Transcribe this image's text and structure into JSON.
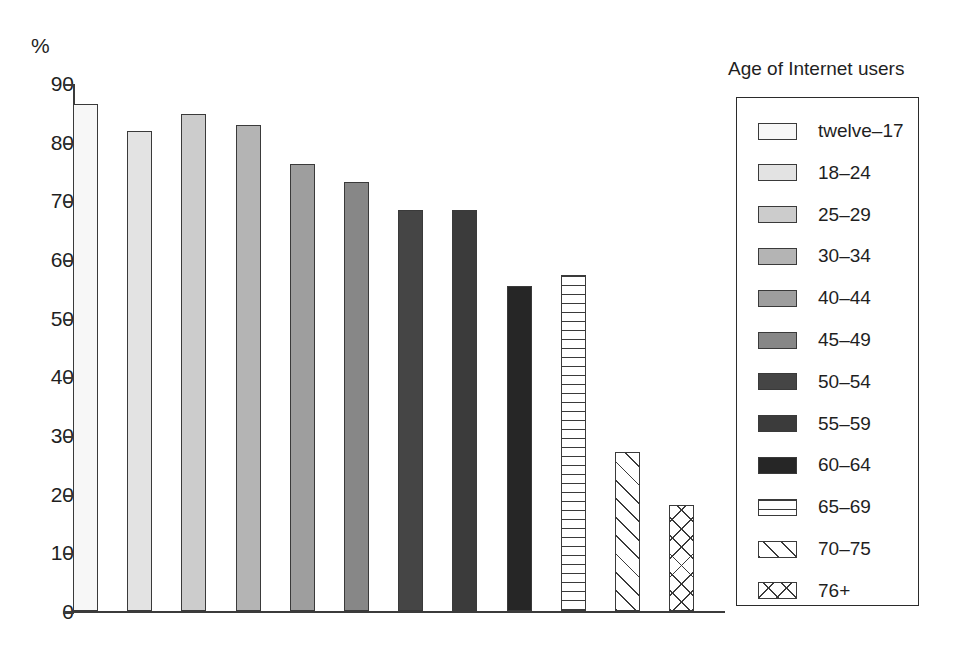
{
  "chart_data": {
    "type": "bar",
    "title": "",
    "xlabel": "",
    "ylabel": "%",
    "ylim": [
      0,
      90
    ],
    "ytick_step": 10,
    "yticks": [
      90,
      80,
      70,
      60,
      50,
      40,
      30,
      20,
      10,
      0
    ],
    "grid": false,
    "legend_position": "right",
    "legend_title": "Age of Internet users",
    "categories": [
      "twelve–17",
      "18–24",
      "25–29",
      "30–34",
      "40–44",
      "45–49",
      "50–54",
      "55–59",
      "60–64",
      "65–69",
      "70–75",
      "76+"
    ],
    "values": [
      86.5,
      81.8,
      84.8,
      82.8,
      76.2,
      73.2,
      68.4,
      68.4,
      55.4,
      57.3,
      27.1,
      18.0
    ],
    "bars": [
      {
        "label": "twelve–17",
        "value": 86.5,
        "fill": "#f7f7f7",
        "pattern": "solid"
      },
      {
        "label": "18–24",
        "value": 81.8,
        "fill": "#e3e3e3",
        "pattern": "solid"
      },
      {
        "label": "25–29",
        "value": 84.8,
        "fill": "#cccccc",
        "pattern": "solid"
      },
      {
        "label": "30–34",
        "value": 82.8,
        "fill": "#b4b4b4",
        "pattern": "solid"
      },
      {
        "label": "40–44",
        "value": 76.2,
        "fill": "#9e9e9e",
        "pattern": "solid"
      },
      {
        "label": "45–49",
        "value": 73.2,
        "fill": "#878787",
        "pattern": "solid"
      },
      {
        "label": "50–54",
        "value": 68.4,
        "fill": "#454545",
        "pattern": "solid"
      },
      {
        "label": "55–59",
        "value": 68.4,
        "fill": "#3b3b3b",
        "pattern": "solid"
      },
      {
        "label": "60–64",
        "value": 55.4,
        "fill": "#262626",
        "pattern": "solid"
      },
      {
        "label": "65–69",
        "value": 57.3,
        "fill": "#ffffff",
        "pattern": "horizontal-stripes"
      },
      {
        "label": "70–75",
        "value": 27.1,
        "fill": "#ffffff",
        "pattern": "diagonal-hatch"
      },
      {
        "label": "76+",
        "value": 18.0,
        "fill": "#ffffff",
        "pattern": "cross-hatch"
      }
    ]
  },
  "legend": {
    "title": "Age of Internet users",
    "items": [
      {
        "label": "twelve–17",
        "fill": "#f7f7f7",
        "pattern": "solid"
      },
      {
        "label": "18–24",
        "fill": "#e3e3e3",
        "pattern": "solid"
      },
      {
        "label": "25–29",
        "fill": "#cccccc",
        "pattern": "solid"
      },
      {
        "label": "30–34",
        "fill": "#b4b4b4",
        "pattern": "solid"
      },
      {
        "label": "40–44",
        "fill": "#9e9e9e",
        "pattern": "solid"
      },
      {
        "label": "45–49",
        "fill": "#878787",
        "pattern": "solid"
      },
      {
        "label": "50–54",
        "fill": "#454545",
        "pattern": "solid"
      },
      {
        "label": "55–59",
        "fill": "#3b3b3b",
        "pattern": "solid"
      },
      {
        "label": "60–64",
        "fill": "#262626",
        "pattern": "solid"
      },
      {
        "label": "65–69",
        "fill": "#ffffff",
        "pattern": "horizontal-stripes"
      },
      {
        "label": "70–75",
        "fill": "#ffffff",
        "pattern": "diagonal-hatch"
      },
      {
        "label": "76+",
        "fill": "#ffffff",
        "pattern": "cross-hatch"
      }
    ]
  },
  "axis": {
    "unit_label": "%",
    "ink_color": "#3b3b3b"
  }
}
